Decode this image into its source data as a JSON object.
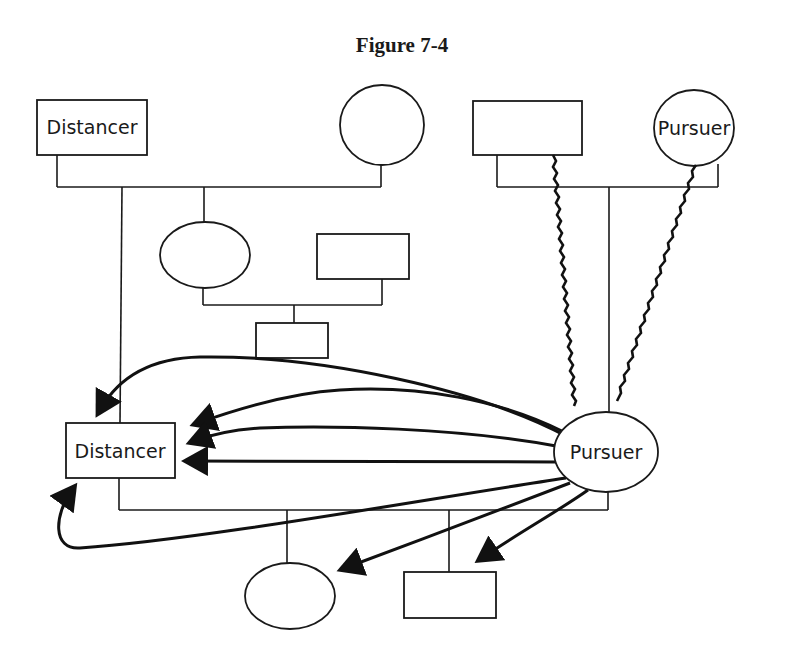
{
  "figure": {
    "title": "Figure 7-4"
  },
  "nodes": {
    "gp_left_male": {
      "label": "Distancer",
      "shape": "rectangle"
    },
    "gp_left_female": {
      "label": "",
      "shape": "circle"
    },
    "gp_right_male": {
      "label": "",
      "shape": "rectangle"
    },
    "gp_right_female": {
      "label": "Pursuer",
      "shape": "circle"
    },
    "aunt": {
      "label": "",
      "shape": "circle"
    },
    "uncle": {
      "label": "",
      "shape": "rectangle"
    },
    "cousin": {
      "label": "",
      "shape": "rectangle"
    },
    "husband": {
      "label": "Distancer",
      "shape": "rectangle"
    },
    "wife": {
      "label": "Pursuer",
      "shape": "circle"
    },
    "daughter": {
      "label": "",
      "shape": "circle"
    },
    "son": {
      "label": "",
      "shape": "rectangle"
    }
  },
  "relationships": {
    "pursuit_arrows": {
      "from": "Pursuer",
      "to": [
        "Distancer",
        "Distancer",
        "Distancer",
        "Distancer",
        "Distancer",
        "daughter",
        "son"
      ],
      "count": 7
    },
    "conflictual_links": {
      "from": "Pursuer",
      "to": [
        "gp_right_male",
        "gp_right_female"
      ],
      "style": "wavy"
    }
  },
  "colors": {
    "line": "#1a1a1a",
    "background": "#ffffff"
  }
}
